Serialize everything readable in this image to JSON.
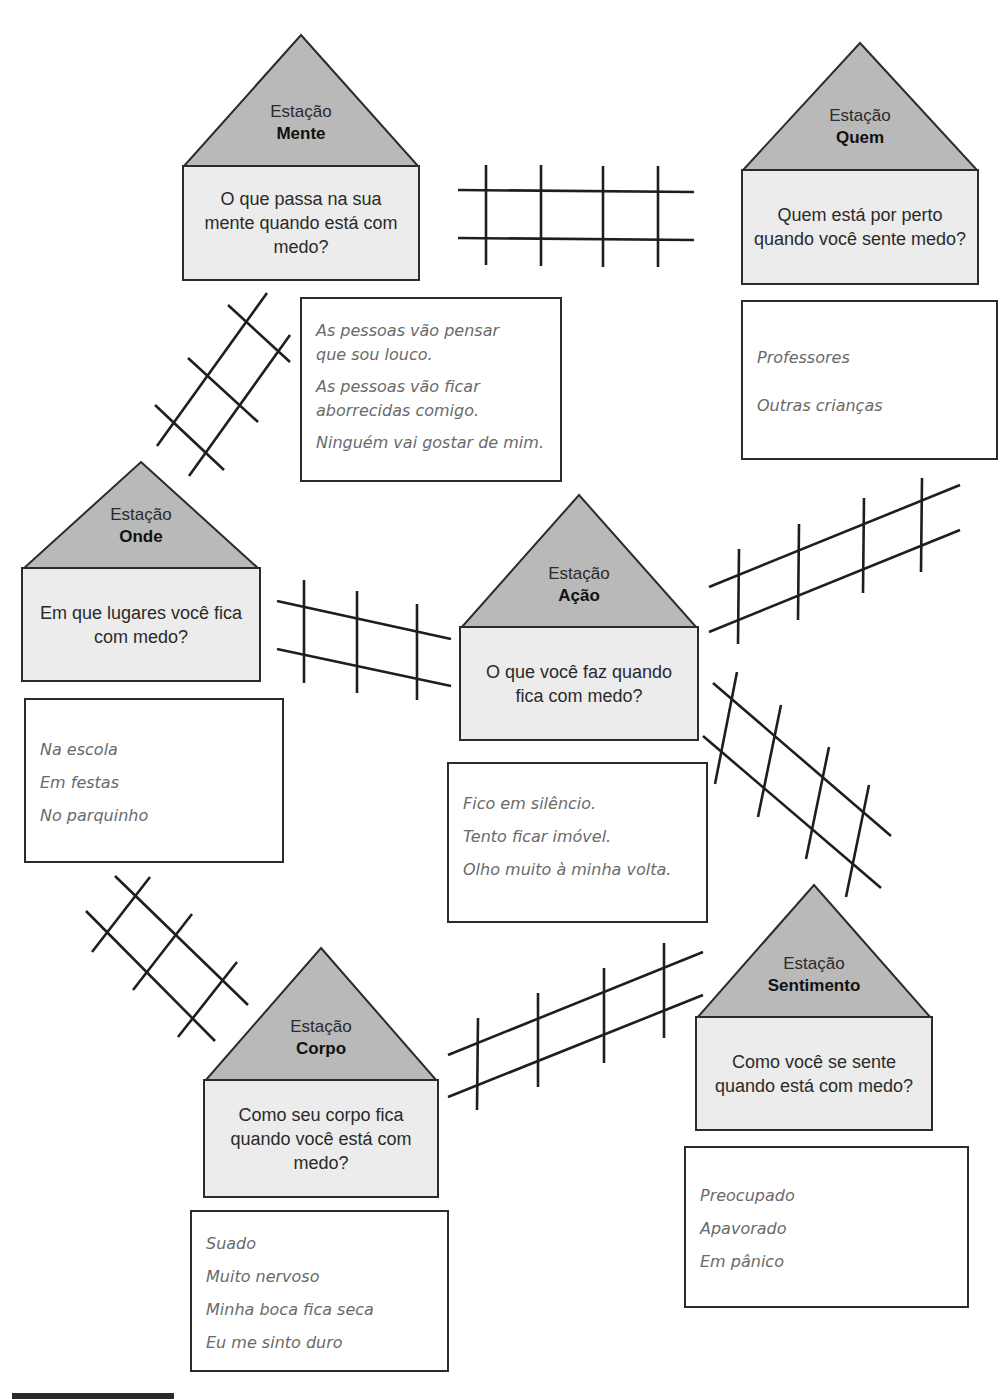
{
  "diagram": {
    "type": "train-station map",
    "station_prefix": "Estação",
    "colors": {
      "roof": "#b9b9b9",
      "body": "#ececec",
      "outline": "#2b2b2b",
      "answer_text": "#6a6a6a",
      "question_text": "#2a2a2a"
    }
  },
  "stations": {
    "mente": {
      "label": "Estação",
      "name": "Mente",
      "question": "O que passa na sua mente quando está com medo?",
      "answers": [
        "As pessoas vão pensar",
        "que sou louco.",
        "As pessoas vão ficar",
        "aborrecidas comigo.",
        "Ninguém vai gostar de mim."
      ]
    },
    "quem": {
      "label": "Estação",
      "name": "Quem",
      "question": "Quem está por perto quando você sente medo?",
      "answers": [
        "Professores",
        "Outras crianças"
      ]
    },
    "onde": {
      "label": "Estação",
      "name": "Onde",
      "question": "Em que lugares você fica com medo?",
      "answers": [
        "Na escola",
        "Em festas",
        "No parquinho"
      ]
    },
    "acao": {
      "label": "Estação",
      "name": "Ação",
      "question": "O que você faz quando fica com medo?",
      "answers": [
        "Fico em silêncio.",
        "Tento ficar imóvel.",
        "Olho muito à minha volta."
      ]
    },
    "sentimento": {
      "label": "Estação",
      "name": "Sentimento",
      "question": "Como você se sente quando está com medo?",
      "answers": [
        "Preocupado",
        "Apavorado",
        "Em pânico"
      ]
    },
    "corpo": {
      "label": "Estação",
      "name": "Corpo",
      "question": "Como seu corpo fica quando você está com medo?",
      "answers": [
        "Suado",
        "Muito nervoso",
        "Minha boca fica seca",
        "Eu me sinto duro"
      ]
    }
  },
  "tracks": [
    {
      "from": "Mente",
      "to": "Quem"
    },
    {
      "from": "Mente",
      "to": "Onde"
    },
    {
      "from": "Onde",
      "to": "Ação"
    },
    {
      "from": "Ação",
      "to": "Quem"
    },
    {
      "from": "Ação",
      "to": "Sentimento"
    },
    {
      "from": "Onde",
      "to": "Corpo"
    },
    {
      "from": "Corpo",
      "to": "Sentimento"
    }
  ]
}
